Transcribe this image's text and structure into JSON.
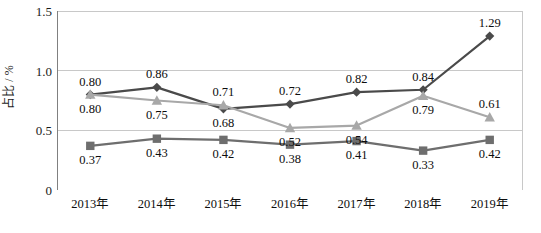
{
  "chart_data": {
    "type": "line",
    "title": "",
    "xlabel": "",
    "ylabel": "占比 / %",
    "categories": [
      "2013年",
      "2014年",
      "2015年",
      "2016年",
      "2017年",
      "2018年",
      "2019年"
    ],
    "ylim": [
      0,
      1.5
    ],
    "yticks": [
      "0",
      "0.5",
      "1.0",
      "1.5"
    ],
    "ytick_values": [
      0,
      0.5,
      1.0,
      1.5
    ],
    "grid": "horizontal",
    "legend": "none",
    "series": [
      {
        "name": "series-diamond",
        "marker": "diamond",
        "color": "#4a4a4a",
        "values": [
          0.8,
          0.86,
          0.68,
          0.72,
          0.82,
          0.84,
          1.29
        ],
        "labels": [
          "0.80",
          "0.86",
          "0.68",
          "0.72",
          "0.82",
          "0.84",
          "1.29"
        ],
        "label_positions": [
          "above",
          "above",
          "below",
          "above",
          "above",
          "above",
          "above"
        ]
      },
      {
        "name": "series-triangle",
        "marker": "triangle",
        "color": "#a8a8a8",
        "values": [
          0.8,
          0.75,
          0.71,
          0.52,
          0.54,
          0.79,
          0.61
        ],
        "labels": [
          "0.80",
          "0.75",
          "0.71",
          "0.52",
          "0.54",
          "0.79",
          "0.61"
        ],
        "label_positions": [
          "below",
          "below",
          "above",
          "below",
          "below",
          "below",
          "above"
        ]
      },
      {
        "name": "series-square",
        "marker": "square",
        "color": "#6e6e6e",
        "values": [
          0.37,
          0.43,
          0.42,
          0.38,
          0.41,
          0.33,
          0.42
        ],
        "labels": [
          "0.37",
          "0.43",
          "0.42",
          "0.38",
          "0.41",
          "0.33",
          "0.42"
        ],
        "label_positions": [
          "below",
          "below",
          "below",
          "below",
          "below",
          "below",
          "below"
        ]
      }
    ],
    "colors": {
      "axis": "#808080",
      "gridline": "#c8c8c8",
      "text": "#0d0d0d",
      "background": "#ffffff"
    }
  }
}
